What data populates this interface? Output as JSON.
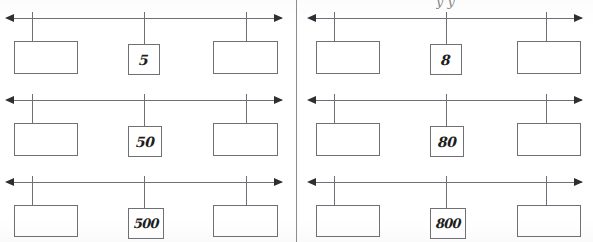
{
  "worksheet": {
    "title": "Number line place-value worksheet",
    "background_color": "#ffffff",
    "ink_color": "#6f6f76",
    "arrow_color": "#2e2e33",
    "divider_color": "#8d8d8d",
    "cropped_header_text": "y  y",
    "panels": [
      {
        "id": "left-panel",
        "name": "left-column",
        "rows": [
          {
            "id": "row-1-left",
            "left_box_value": "",
            "middle_box_value": "5",
            "right_box_value": "",
            "arrow_left": "◀",
            "arrow_right": "▶"
          },
          {
            "id": "row-2-left",
            "left_box_value": "",
            "middle_box_value": "50",
            "right_box_value": "",
            "arrow_left": "◀",
            "arrow_right": "▶"
          },
          {
            "id": "row-3-left",
            "left_box_value": "",
            "middle_box_value": "500",
            "right_box_value": "",
            "arrow_left": "◀",
            "arrow_right": "▶"
          }
        ]
      },
      {
        "id": "right-panel",
        "name": "right-column",
        "rows": [
          {
            "id": "row-1-right",
            "left_box_value": "",
            "middle_box_value": "8",
            "right_box_value": "",
            "arrow_left": "◀",
            "arrow_right": "▶"
          },
          {
            "id": "row-2-right",
            "left_box_value": "",
            "middle_box_value": "80",
            "right_box_value": "",
            "arrow_left": "◀",
            "arrow_right": "▶"
          },
          {
            "id": "row-3-right",
            "left_box_value": "",
            "middle_box_value": "800",
            "right_box_value": "",
            "arrow_left": "◀",
            "arrow_right": "▶"
          }
        ]
      }
    ]
  }
}
